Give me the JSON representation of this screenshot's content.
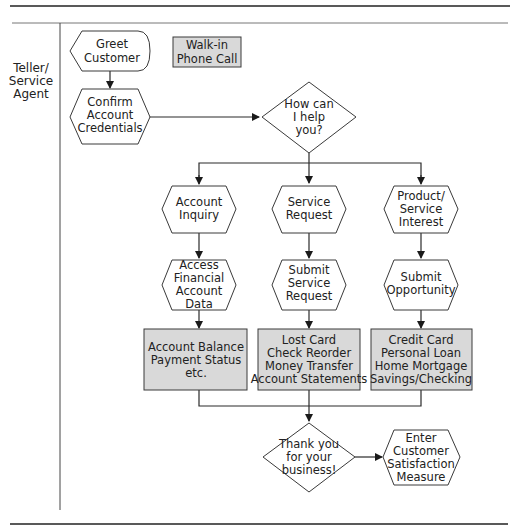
{
  "lane": {
    "label_lines": [
      "Teller/",
      "Service",
      "Agent"
    ]
  },
  "legend": {
    "lines": [
      "Walk-in",
      "Phone Call"
    ]
  },
  "nodes": {
    "greet": {
      "lines": [
        "Greet",
        "Customer"
      ]
    },
    "confirm": {
      "lines": [
        "Confirm",
        "Account",
        "Credentials"
      ]
    },
    "decision": {
      "lines": [
        "How can",
        "I help",
        "you?"
      ]
    },
    "inquiry": {
      "lines": [
        "Account",
        "Inquiry"
      ]
    },
    "service": {
      "lines": [
        "Service",
        "Request"
      ]
    },
    "product": {
      "lines": [
        "Product/",
        "Service",
        "Interest"
      ]
    },
    "access": {
      "lines": [
        "Access",
        "Financial",
        "Account",
        "Data"
      ]
    },
    "submit_service": {
      "lines": [
        "Submit",
        "Service",
        "Request"
      ]
    },
    "submit_opp": {
      "lines": [
        "Submit",
        "Opportunity"
      ]
    },
    "box_inquiry": {
      "lines": [
        "Account Balance",
        "Payment Status",
        "etc."
      ]
    },
    "box_service": {
      "lines": [
        "Lost Card",
        "Check Reorder",
        "Money Transfer",
        "Account Statements"
      ]
    },
    "box_product": {
      "lines": [
        "Credit Card",
        "Personal Loan",
        "Home Mortgage",
        "Savings/Checking"
      ]
    },
    "thanks": {
      "lines": [
        "Thank you",
        "for your",
        "business!"
      ]
    },
    "satisfaction": {
      "lines": [
        "Enter",
        "Customer",
        "Satisfaction",
        "Measure"
      ]
    }
  },
  "colors": {
    "box_fill": "#d9d9d9",
    "line": "#2a2a2a"
  }
}
